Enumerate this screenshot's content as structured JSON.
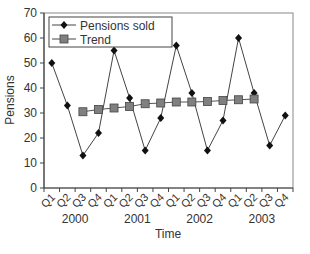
{
  "chart_data": {
    "type": "line",
    "title": "",
    "xlabel": "Time",
    "ylabel": "Pensions",
    "ylim": [
      0,
      70
    ],
    "yticks": [
      0,
      10,
      20,
      30,
      40,
      50,
      60,
      70
    ],
    "grid": false,
    "legend_position": "top-left inside",
    "categories": [
      "Q1",
      "Q2",
      "Q3",
      "Q4",
      "Q1",
      "Q2",
      "Q3",
      "Q4",
      "Q1",
      "Q2",
      "Q3",
      "Q4",
      "Q1",
      "Q2",
      "Q3",
      "Q4"
    ],
    "years": [
      "2000",
      "2001",
      "2002",
      "2003"
    ],
    "series": [
      {
        "name": "Pensions sold",
        "marker": "diamond",
        "color": "#111111",
        "values": [
          50,
          33,
          13,
          22,
          55,
          36,
          15,
          28,
          57,
          38,
          15,
          27,
          60,
          38,
          17,
          29
        ]
      },
      {
        "name": "Trend",
        "marker": "square",
        "color": "#666666",
        "values": [
          null,
          null,
          30.5,
          31.4,
          32.0,
          32.6,
          33.7,
          34.0,
          34.4,
          34.4,
          34.6,
          35.0,
          35.3,
          35.6,
          null,
          null
        ]
      }
    ]
  }
}
